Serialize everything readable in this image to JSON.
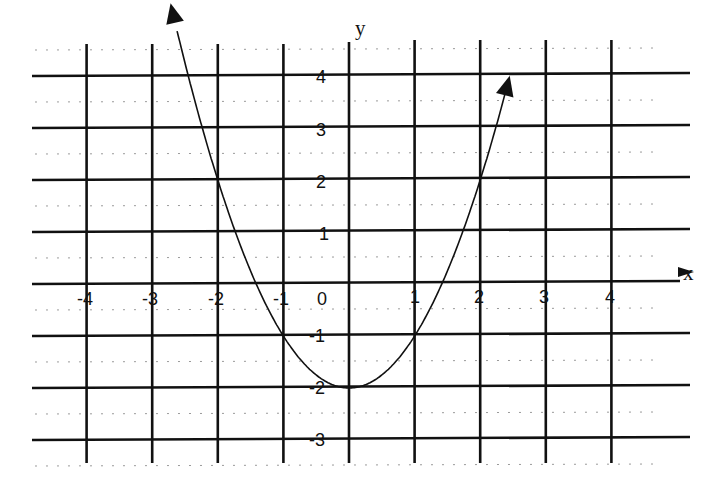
{
  "chart_data": {
    "type": "line",
    "title": "",
    "xlabel": "x",
    "ylabel": "y",
    "function": "y = x^2 - 2",
    "x_ticks": [
      -4,
      -3,
      -2,
      -1,
      0,
      1,
      2,
      3,
      4
    ],
    "y_ticks": [
      4,
      3,
      2,
      1,
      -1,
      -2,
      -3
    ],
    "xlim": [
      -4.5,
      5
    ],
    "ylim": [
      -3.5,
      4.6
    ],
    "grid": true,
    "legend": null,
    "series": [
      {
        "name": "parabola",
        "x": [
          -2.6,
          -2,
          -1.5,
          -1,
          -0.5,
          0,
          0.5,
          1,
          1.5,
          2,
          2.4
        ],
        "y": [
          4.76,
          2,
          0.25,
          -1,
          -1.75,
          -2,
          -1.75,
          -1,
          0.25,
          2,
          3.76
        ],
        "arrows": "both-ends"
      }
    ],
    "key_points": [
      {
        "x": -2,
        "y": 2
      },
      {
        "x": -1,
        "y": -1
      },
      {
        "x": 0,
        "y": -2
      },
      {
        "x": 1,
        "y": -1
      },
      {
        "x": 2,
        "y": 2
      }
    ]
  },
  "labels": {
    "x_axis_title": "x",
    "y_axis_title": "y",
    "x_tick_labels": [
      "-4",
      "-3",
      "-2",
      "-1",
      "0",
      "1",
      "2",
      "3",
      "4"
    ],
    "y_tick_labels": [
      "4",
      "3",
      "2",
      "1",
      "-1",
      "-2",
      "-3"
    ]
  }
}
